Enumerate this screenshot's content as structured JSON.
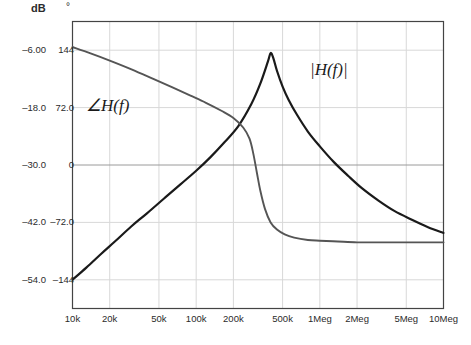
{
  "chart_data": {
    "type": "line",
    "title": "",
    "xlabel": "",
    "ylabel_left": "dB",
    "ylabel_right": "°",
    "xscale": "log",
    "xlim": [
      10000,
      10000000
    ],
    "grid": true,
    "legend": "annotations",
    "xticks": [
      {
        "value": 10000,
        "label": "10k"
      },
      {
        "value": 20000,
        "label": "20k"
      },
      {
        "value": 50000,
        "label": "50k"
      },
      {
        "value": 100000,
        "label": "100k"
      },
      {
        "value": 200000,
        "label": "200k"
      },
      {
        "value": 500000,
        "label": "500k"
      },
      {
        "value": 1000000,
        "label": "1Meg"
      },
      {
        "value": 2000000,
        "label": "2Meg"
      },
      {
        "value": 5000000,
        "label": "5Meg"
      },
      {
        "value": 10000000,
        "label": "10Meg"
      }
    ],
    "yticks_db": [
      {
        "value": -6.0,
        "label": "–6.00"
      },
      {
        "value": -18.0,
        "label": "–18.0"
      },
      {
        "value": -30.0,
        "label": "–30.0"
      },
      {
        "value": -42.0,
        "label": "–42.0"
      },
      {
        "value": -54.0,
        "label": "–54.0"
      }
    ],
    "yticks_deg": [
      {
        "value": 144,
        "label": "144"
      },
      {
        "value": 72,
        "label": "72.0"
      },
      {
        "value": 0,
        "label": "0"
      },
      {
        "value": -72,
        "label": "–72.0"
      },
      {
        "value": -144,
        "label": "–144"
      }
    ],
    "ylim_db": [
      -60,
      0
    ],
    "ylim_deg": [
      -180,
      180
    ],
    "series": [
      {
        "name": "|H(f)|",
        "annotation": "|H(f)|",
        "axis": "db",
        "color": "#1a1a1a",
        "x": [
          10000,
          13000,
          17000,
          22000,
          30000,
          40000,
          55000,
          75000,
          100000,
          130000,
          170000,
          220000,
          280000,
          330000,
          380000,
          400000,
          420000,
          450000,
          500000,
          560000,
          650000,
          800000,
          1000000,
          1300000,
          1700000,
          2200000,
          3000000,
          4000000,
          5500000,
          7500000,
          10000000
        ],
        "y": [
          -54.0,
          -51.4,
          -48.6,
          -46.0,
          -42.8,
          -40.1,
          -37.0,
          -34.0,
          -31.2,
          -28.4,
          -25.2,
          -21.8,
          -17.2,
          -13.0,
          -8.4,
          -6.6,
          -7.6,
          -10.3,
          -13.6,
          -16.4,
          -19.4,
          -23.0,
          -26.1,
          -29.4,
          -32.3,
          -34.9,
          -37.5,
          -39.6,
          -41.4,
          -43.0,
          -44.2
        ]
      },
      {
        "name": "∠H(f)",
        "annotation": "∠H(f)",
        "axis": "deg",
        "color": "#555555",
        "x": [
          10000,
          14000,
          20000,
          30000,
          45000,
          65000,
          90000,
          120000,
          160000,
          200000,
          240000,
          270000,
          290000,
          310000,
          330000,
          360000,
          400000,
          450000,
          520000,
          620000,
          800000,
          1000000,
          1400000,
          2000000,
          3000000,
          4500000,
          7000000,
          10000000
        ],
        "y": [
          148,
          140,
          131,
          120,
          108,
          97,
          87,
          78,
          68,
          59,
          47,
          33,
          14,
          -10,
          -32,
          -55,
          -72,
          -81,
          -87,
          -91,
          -94,
          -95,
          -96,
          -97,
          -97,
          -97,
          -97,
          -97
        ]
      }
    ],
    "annotations": [
      {
        "text": "∠H(f)",
        "x_px": 86,
        "y_px": 95
      },
      {
        "text": "|H(f)|",
        "x_px": 310,
        "y_px": 60
      }
    ]
  },
  "axis_headers": {
    "db": "dB",
    "deg": "°"
  }
}
